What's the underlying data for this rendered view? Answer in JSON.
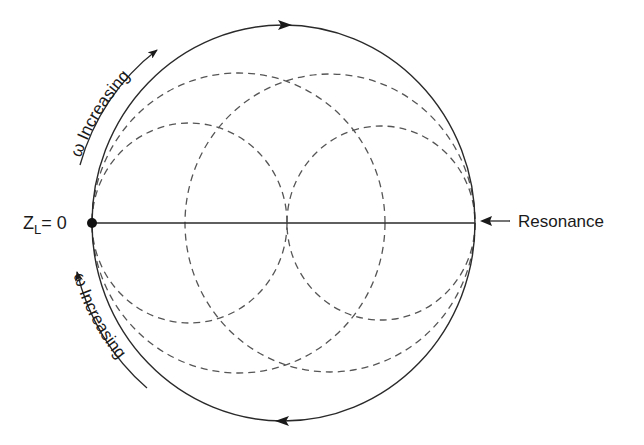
{
  "diagram": {
    "type": "impedance-locus",
    "labels": {
      "origin": "Z",
      "origin_subscript": "L",
      "origin_value": "= 0",
      "resonance": "Resonance",
      "top_arrow_label": "ω Increasing",
      "bottom_arrow_label": "ω Increasing"
    },
    "colors": {
      "stroke": "#2a2a2a",
      "dashed": "#555555",
      "text": "#1a1a1a"
    },
    "geometry": {
      "outer_circle": {
        "cx": 283.5,
        "cy": 223,
        "rx": 191.5,
        "ry": 198
      },
      "axis": {
        "x1": 92,
        "x2": 475,
        "y": 223
      },
      "dashed_circles": [
        {
          "cx": 189.5,
          "cy": 223,
          "rx": 97.5,
          "ry": 100
        },
        {
          "cx": 381,
          "cy": 223,
          "rx": 94,
          "ry": 97
        },
        {
          "cx": 238.5,
          "cy": 223,
          "rx": 146.5,
          "ry": 150
        },
        {
          "cx": 330,
          "cy": 223,
          "rx": 145,
          "ry": 149
        }
      ]
    }
  }
}
